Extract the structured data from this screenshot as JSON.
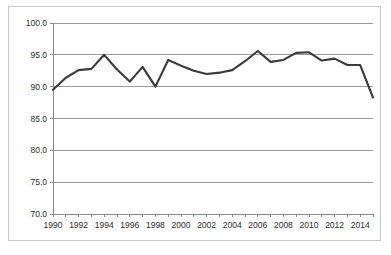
{
  "chart_data": {
    "type": "line",
    "title": "",
    "subtitle": "",
    "xlabel": "",
    "ylabel": "",
    "grid": "horizontal",
    "legend": "none",
    "xlim": [
      1990,
      2015
    ],
    "ylim": [
      70.0,
      100.0
    ],
    "ytick_step": 5.0,
    "xtick_step": 1,
    "xlabel_step": 2,
    "line_color": "#3a3a3a",
    "axis_color": "#8a8a8a",
    "grid_color": "#9a9a9a",
    "border_color": "#c8c8c8",
    "ytick_labels": [
      "100.0",
      "95.0",
      "90.0",
      "85.0",
      "80.0",
      "75.0",
      "70.0"
    ],
    "ytick_values": [
      100.0,
      95.0,
      90.0,
      85.0,
      80.0,
      75.0,
      70.0
    ],
    "xtick_labels": [
      "1990",
      "",
      "1992",
      "",
      "1994",
      "",
      "1996",
      "",
      "1998",
      "",
      "2000",
      "",
      "2002",
      "",
      "2004",
      "",
      "2006",
      "",
      "2008",
      "",
      "2010",
      "",
      "2012",
      "",
      "2014",
      ""
    ],
    "x": [
      1990,
      1991,
      1992,
      1993,
      1994,
      1995,
      1996,
      1997,
      1998,
      1999,
      2000,
      2001,
      2002,
      2003,
      2004,
      2005,
      2006,
      2007,
      2008,
      2009,
      2010,
      2011,
      2012,
      2013,
      2014,
      2015
    ],
    "values": [
      89.5,
      91.4,
      92.6,
      92.8,
      95.0,
      92.7,
      90.8,
      93.1,
      90.0,
      94.2,
      93.3,
      92.5,
      92.0,
      92.2,
      92.6,
      94.0,
      95.6,
      93.9,
      94.2,
      95.3,
      95.4,
      94.1,
      94.4,
      93.4,
      93.4,
      88.3
    ],
    "series": [
      {
        "name": "series-1",
        "values": [
          89.5,
          91.4,
          92.6,
          92.8,
          95.0,
          92.7,
          90.8,
          93.1,
          90.0,
          94.2,
          93.3,
          92.5,
          92.0,
          92.2,
          92.6,
          94.0,
          95.6,
          93.9,
          94.2,
          95.3,
          95.4,
          94.1,
          94.4,
          93.4,
          93.4,
          88.3
        ]
      }
    ]
  }
}
